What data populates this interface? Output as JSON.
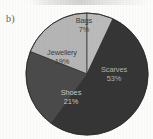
{
  "panel": {
    "label": "b)"
  },
  "colors": {
    "background": "#fdfdfc",
    "scarves": "#363636",
    "shoes": "#4b4b4b",
    "jewellery": "#b6b6b6",
    "bags": "#bcbcbc",
    "outline": "#2f2f2f",
    "label_dark": "#3a3a3a",
    "label_light": "#c4c4c4"
  },
  "chart_data": {
    "type": "pie",
    "title": "",
    "subtitle": "",
    "xlabel": "",
    "ylabel": "",
    "legend": "none (direct slice labels)",
    "grid": false,
    "units": "percent",
    "total": 100,
    "categories": [
      "Bags",
      "Scarves",
      "Shoes",
      "Jewellery"
    ],
    "values": [
      7,
      53,
      21,
      19
    ],
    "labels": [
      "7%",
      "53%",
      "21%",
      "19%"
    ],
    "slices": [
      {
        "name": "Bags",
        "value": 7,
        "label": "7%",
        "color": "#bcbcbc",
        "start_angle_deg": 0,
        "end_angle_deg": 25.2,
        "label_color": "#3c3c3c"
      },
      {
        "name": "Scarves",
        "value": 53,
        "label": "53%",
        "color": "#363636",
        "start_angle_deg": 25.2,
        "end_angle_deg": 216.0,
        "label_color": "#b4b4b4"
      },
      {
        "name": "Shoes",
        "value": 21,
        "label": "21%",
        "color": "#4b4b4b",
        "start_angle_deg": 216.0,
        "end_angle_deg": 291.6,
        "label_color": "#c9c9c9"
      },
      {
        "name": "Jewellery",
        "value": 19,
        "label": "19%",
        "color": "#b6b6b6",
        "start_angle_deg": 291.6,
        "end_angle_deg": 360.0,
        "label_color": "#3a3a3a"
      }
    ]
  }
}
